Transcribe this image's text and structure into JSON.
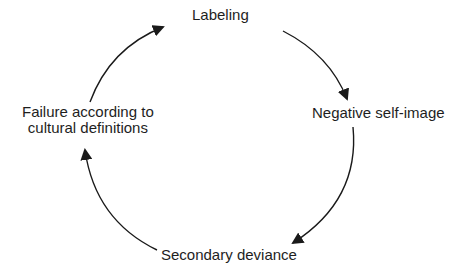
{
  "diagram": {
    "type": "cycle",
    "nodes": [
      {
        "id": "labeling",
        "label": "Labeling"
      },
      {
        "id": "negative_self_image",
        "label": "Negative self-image"
      },
      {
        "id": "secondary_deviance",
        "label": "Secondary deviance"
      },
      {
        "id": "failure",
        "label_lines": [
          "Failure according to",
          "cultural definitions"
        ]
      }
    ],
    "edges": [
      {
        "from": "labeling",
        "to": "negative_self_image"
      },
      {
        "from": "negative_self_image",
        "to": "secondary_deviance"
      },
      {
        "from": "secondary_deviance",
        "to": "failure"
      },
      {
        "from": "failure",
        "to": "labeling"
      }
    ],
    "colors": {
      "arrow": "#1a1a1a",
      "text": "#1e1e1e",
      "background": "#ffffff"
    }
  }
}
